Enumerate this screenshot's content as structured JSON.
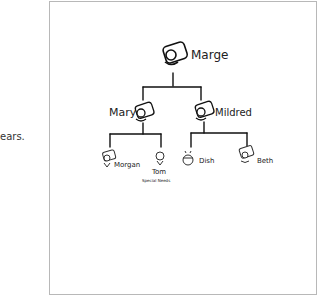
{
  "page": {
    "side_text": "ears."
  },
  "tree": {
    "root": {
      "name": "Marge"
    },
    "children": [
      {
        "name": "Mary",
        "children": [
          {
            "name": "Morgan"
          },
          {
            "name": "Tom",
            "note": "Special Needs"
          }
        ]
      },
      {
        "name": "Mildred",
        "children": [
          {
            "name": "Dish"
          },
          {
            "name": "Beth"
          }
        ]
      }
    ]
  }
}
